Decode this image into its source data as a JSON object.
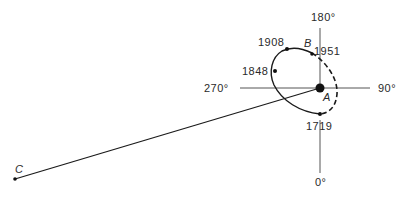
{
  "diagram": {
    "axes": {
      "top": "180°",
      "bottom": "0°",
      "left": "270°",
      "right": "90°"
    },
    "points": {
      "center": "A",
      "orbit_point": "B",
      "far_point": "C"
    },
    "years": {
      "y1908": "1908",
      "y1951": "1951",
      "y1848": "1848",
      "y1719": "1719"
    },
    "colors": {
      "line": "#1a1a1a",
      "axis": "#555555",
      "text": "#2a2a2a"
    }
  }
}
